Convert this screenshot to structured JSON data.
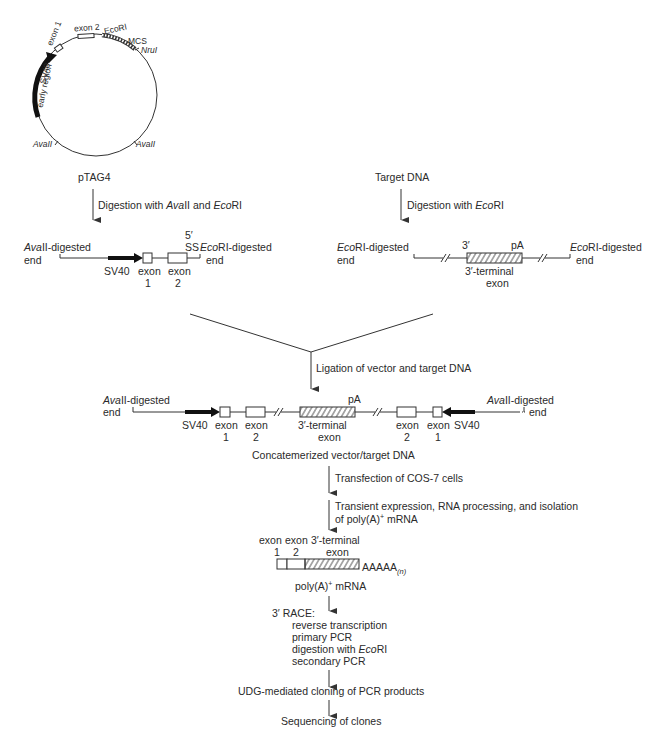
{
  "plasmid": {
    "name": "pTAG4",
    "labels": {
      "exon1": "exon 1",
      "exon2": "exon 2",
      "ecori": "EcoRI",
      "mcs": "MCS",
      "nrui": "NruI",
      "sv40_line1": "SV40",
      "sv40_line2": "early region",
      "avaii_left": "AvaII",
      "avaii_right": "AvaII"
    }
  },
  "left_branch": {
    "source": "pTAG4",
    "step": {
      "pre": "Digestion with ",
      "enz1": "Ava",
      "enz1b": "II",
      "mid": " and ",
      "enz2": "Eco",
      "enz2b": "RI"
    },
    "left_end": {
      "l1i": "Ava",
      "l1": "II-digested",
      "l2": "end"
    },
    "right_end": {
      "l1i": "Eco",
      "l1": "RI-digested",
      "l2": "end"
    },
    "ss_l1": "5′",
    "ss_l2": "SS",
    "sv40": "SV40",
    "exon1_l1": "exon",
    "exon1_l2": "1",
    "exon2_l1": "exon",
    "exon2_l2": "2"
  },
  "right_branch": {
    "source": "Target DNA",
    "step": {
      "pre": "Digestion with ",
      "enzi": "Eco",
      "enz": "RI"
    },
    "left_end": {
      "l1i": "Eco",
      "l1": "RI-digested",
      "l2": "end"
    },
    "right_end": {
      "l1i": "Eco",
      "l1": "RI-digested",
      "l2": "end"
    },
    "three_prime": "3′",
    "pa": "pA",
    "term_l1": "3′-terminal",
    "term_l2": "exon"
  },
  "ligation": {
    "step": "Ligation of vector and target DNA",
    "left_end": {
      "l1i": "Ava",
      "l1": "II-digested",
      "l2": "end"
    },
    "right_end": {
      "l1i": "Ava",
      "l1": "II-digested",
      "l2": "end"
    },
    "sv40_left": "SV40",
    "sv40_right": "SV40",
    "exon_word": "exon",
    "n1": "1",
    "n2": "2",
    "pa": "pA",
    "term_l1": "3′-terminal",
    "term_l2": "exon",
    "result": "Concatemerized vector/target DNA"
  },
  "steps": {
    "transfection": "Transfection of COS-7 cells",
    "expression_l1": "Transient expression, RNA processing, and isolation",
    "expression_l2_pre": "of poly(A)",
    "expression_l2_sup": "+",
    "expression_l2_post": " mRNA"
  },
  "mrna": {
    "exon1_l1": "exon",
    "exon1_l2": "1",
    "exon2_l1": "exon",
    "exon2_l2": "2",
    "term_l1": "3′-terminal",
    "term_l2": "exon",
    "polya": "AAAAA",
    "polya_sub": "(n)",
    "label_pre": "poly(A)",
    "label_sup": "+",
    "label_post": " mRNA"
  },
  "race": {
    "title": "3′ RACE:",
    "items": [
      "reverse transcription",
      "primary PCR",
      "digestion with ",
      "secondary PCR"
    ],
    "item3_i": "Eco",
    "item3_b": "RI"
  },
  "final_steps": {
    "cloning": "UDG-mediated cloning of PCR products",
    "sequencing": "Sequencing of clones"
  }
}
